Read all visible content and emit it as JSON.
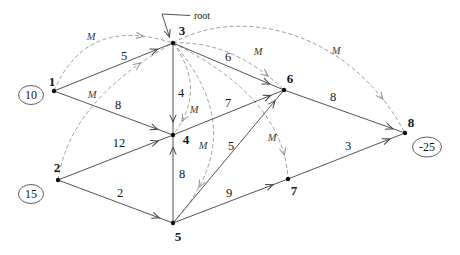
{
  "figure": {
    "type": "directed-network-graph",
    "root_pointer": {
      "label": "root",
      "text_x": 194,
      "text_y": 15,
      "elbow": [
        [
          190,
          15.5
        ],
        [
          162,
          14
        ]
      ],
      "arrow_from": [
        162,
        14
      ],
      "arrow_to": [
        169.5,
        37
      ]
    },
    "big_m": "M",
    "nodes": [
      {
        "id": "1",
        "x": 54,
        "y": 91,
        "label_x": 52,
        "label_y": 81
      },
      {
        "id": "2",
        "x": 58,
        "y": 180,
        "label_x": 57,
        "label_y": 167
      },
      {
        "id": "3",
        "x": 173,
        "y": 43,
        "label_x": 182,
        "label_y": 30
      },
      {
        "id": "4",
        "x": 173,
        "y": 135,
        "label_x": 186,
        "label_y": 139
      },
      {
        "id": "5",
        "x": 173,
        "y": 223,
        "label_x": 178,
        "label_y": 236
      },
      {
        "id": "6",
        "x": 284,
        "y": 90,
        "label_x": 290,
        "label_y": 78
      },
      {
        "id": "7",
        "x": 288,
        "y": 179,
        "label_x": 294,
        "label_y": 190
      },
      {
        "id": "8",
        "x": 405,
        "y": 133,
        "label_x": 411,
        "label_y": 122
      }
    ],
    "node_values": [
      {
        "node": "1",
        "value": "10",
        "x": 31,
        "y": 95,
        "rx": 12.5,
        "ry": 9.5
      },
      {
        "node": "2",
        "value": "15",
        "x": 31,
        "y": 194,
        "rx": 12.5,
        "ry": 9.5
      },
      {
        "node": "8",
        "value": "-25",
        "x": 427,
        "y": 147,
        "rx": 14.5,
        "ry": 10
      }
    ],
    "edges": [
      {
        "from": "1",
        "to": "3",
        "weight": "5",
        "wx": 124,
        "wy": 56,
        "at": 0.87
      },
      {
        "from": "1",
        "to": "4",
        "weight": "8",
        "wx": 118,
        "wy": 105,
        "at": 0.87
      },
      {
        "from": "2",
        "to": "4",
        "weight": "12",
        "wx": 119,
        "wy": 143,
        "at": 0.87
      },
      {
        "from": "2",
        "to": "5",
        "weight": "2",
        "wx": 120,
        "wy": 193,
        "at": 0.88
      },
      {
        "from": "3",
        "to": "4",
        "weight": "4",
        "wx": 181,
        "wy": 93,
        "at": 0.86
      },
      {
        "from": "5",
        "to": "4",
        "weight": "8",
        "wx": 182,
        "wy": 174,
        "at": 0.86
      },
      {
        "from": "3",
        "to": "6",
        "weight": "6",
        "wx": 228,
        "wy": 57,
        "at": 0.87
      },
      {
        "from": "4",
        "to": "6",
        "weight": "7",
        "wx": 228,
        "wy": 103,
        "at": 0.88
      },
      {
        "from": "5",
        "to": "6",
        "weight": "5",
        "wx": 231,
        "wy": 146,
        "at": 0.92
      },
      {
        "from": "5",
        "to": "7",
        "weight": "9",
        "wx": 229,
        "wy": 193,
        "at": 0.87
      },
      {
        "from": "6",
        "to": "8",
        "weight": "8",
        "wx": 333,
        "wy": 97,
        "at": 0.9
      },
      {
        "from": "7",
        "to": "8",
        "weight": "3",
        "wx": 348,
        "wy": 146,
        "at": 0.87
      }
    ],
    "m_arcs": [
      {
        "from": "1",
        "to": "3",
        "cx": 86,
        "cy": 15,
        "mx": 91,
        "my": 36,
        "at": 0.82
      },
      {
        "from": "2",
        "to": "3",
        "cx": 70,
        "cy": 100,
        "mx": 92,
        "my": 94,
        "at": 0.83
      },
      {
        "from": "3",
        "to": "4",
        "cx": 208,
        "cy": 90,
        "mx": 194,
        "my": 109,
        "at": 0.85
      },
      {
        "from": "3",
        "to": "5",
        "cx": 254,
        "cy": 134,
        "mx": 203,
        "my": 145,
        "at": 0.8
      },
      {
        "from": "3",
        "to": "6",
        "cx": 232,
        "cy": 40,
        "mx": 258,
        "my": 51,
        "at": 0.85
      },
      {
        "from": "3",
        "to": "7",
        "cx": 284,
        "cy": 98,
        "mx": 272,
        "my": 137,
        "at": 0.85
      },
      {
        "from": "3",
        "to": "8",
        "cubic": [
          240,
          5,
          350,
          30
        ],
        "mx": 336,
        "my": 50,
        "at": 0.88
      }
    ],
    "colors": {
      "edge": "#404040",
      "arc": "#929292",
      "node_fill": "#101010",
      "text": "#161616",
      "m_text": "#3d3d3d",
      "ellipse_stroke": "#4d4d4d",
      "background": "#ffffff"
    }
  }
}
